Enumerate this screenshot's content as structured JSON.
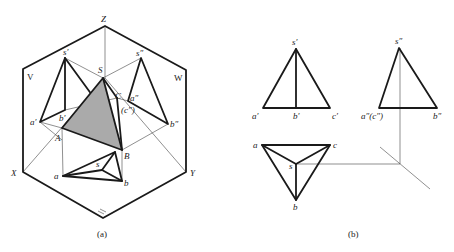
{
  "figure_a": {
    "caption": "(a)",
    "fill_color": "#aaaaaa",
    "axis_labels": {
      "Z": "Z",
      "X": "X",
      "Y": "Y",
      "V": "V",
      "W": "W",
      "H": "H"
    },
    "space_points": {
      "S": "S",
      "A": "A",
      "B": "B",
      "C": "C"
    },
    "v_projection": {
      "s": "s′",
      "a": "a′",
      "b": "b′"
    },
    "w_projection": {
      "s": "s″",
      "a": "a″",
      "c": "(c″)",
      "b": "b″"
    },
    "h_projection": {
      "a": "a",
      "s": "s",
      "b": "b"
    }
  },
  "figure_b": {
    "caption": "(b)",
    "front_view": {
      "s": "s′",
      "a": "a′",
      "b": "b′",
      "c": "c′"
    },
    "side_view": {
      "s": "s″",
      "ac": "a″(c″)",
      "b": "b″"
    },
    "top_view": {
      "a": "a",
      "c": "c",
      "s": "s",
      "b": "b"
    }
  }
}
